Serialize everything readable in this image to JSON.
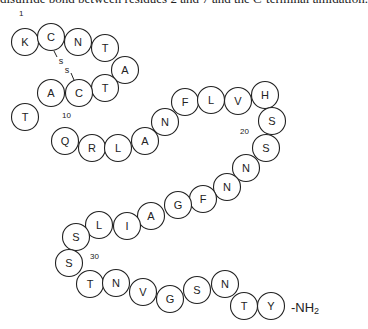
{
  "caption": "disulfide bond between residues 2 and 7 and the C-terminal amidation.",
  "peptide": {
    "residues": [
      {
        "n": 1,
        "aa": "K",
        "x": 25,
        "y": 42
      },
      {
        "n": 2,
        "aa": "C",
        "x": 51,
        "y": 37
      },
      {
        "n": 3,
        "aa": "N",
        "x": 78,
        "y": 42
      },
      {
        "n": 4,
        "aa": "T",
        "x": 105,
        "y": 48
      },
      {
        "n": 5,
        "aa": "A",
        "x": 125,
        "y": 70
      },
      {
        "n": 6,
        "aa": "T",
        "x": 105,
        "y": 88
      },
      {
        "n": 7,
        "aa": "C",
        "x": 79,
        "y": 93
      },
      {
        "n": 8,
        "aa": "A",
        "x": 51,
        "y": 93
      },
      {
        "n": 9,
        "aa": "T",
        "x": 25,
        "y": 117
      },
      {
        "n": 10,
        "aa": "Q",
        "x": 65,
        "y": 141
      },
      {
        "n": 11,
        "aa": "R",
        "x": 92,
        "y": 148
      },
      {
        "n": 12,
        "aa": "L",
        "x": 118,
        "y": 148
      },
      {
        "n": 13,
        "aa": "A",
        "x": 145,
        "y": 141
      },
      {
        "n": 14,
        "aa": "N",
        "x": 165,
        "y": 122
      },
      {
        "n": 15,
        "aa": "F",
        "x": 185,
        "y": 102
      },
      {
        "n": 16,
        "aa": "L",
        "x": 211,
        "y": 100
      },
      {
        "n": 17,
        "aa": "V",
        "x": 238,
        "y": 101
      },
      {
        "n": 18,
        "aa": "H",
        "x": 265,
        "y": 95
      },
      {
        "n": 19,
        "aa": "S",
        "x": 272,
        "y": 121
      },
      {
        "n": 20,
        "aa": "S",
        "x": 266,
        "y": 148
      },
      {
        "n": 21,
        "aa": "N",
        "x": 246,
        "y": 168
      },
      {
        "n": 22,
        "aa": "N",
        "x": 227,
        "y": 187
      },
      {
        "n": 23,
        "aa": "F",
        "x": 203,
        "y": 199
      },
      {
        "n": 24,
        "aa": "G",
        "x": 178,
        "y": 205
      },
      {
        "n": 25,
        "aa": "A",
        "x": 151,
        "y": 216
      },
      {
        "n": 26,
        "aa": "I",
        "x": 127,
        "y": 226
      },
      {
        "n": 27,
        "aa": "L",
        "x": 99,
        "y": 225
      },
      {
        "n": 28,
        "aa": "S",
        "x": 76,
        "y": 237
      },
      {
        "n": 29,
        "aa": "S",
        "x": 69,
        "y": 263
      },
      {
        "n": 30,
        "aa": "T",
        "x": 90,
        "y": 284
      },
      {
        "n": 31,
        "aa": "N",
        "x": 116,
        "y": 283
      },
      {
        "n": 32,
        "aa": "V",
        "x": 143,
        "y": 292
      },
      {
        "n": 33,
        "aa": "G",
        "x": 170,
        "y": 299
      },
      {
        "n": 34,
        "aa": "S",
        "x": 197,
        "y": 290
      },
      {
        "n": 35,
        "aa": "N",
        "x": 225,
        "y": 284
      },
      {
        "n": 36,
        "aa": "T",
        "x": 244,
        "y": 306
      },
      {
        "n": 37,
        "aa": "Y",
        "x": 271,
        "y": 306
      }
    ],
    "position_labels": [
      {
        "text": "1",
        "x": 19,
        "y": 16
      },
      {
        "text": "10",
        "x": 62,
        "y": 118
      },
      {
        "text": "20",
        "x": 240,
        "y": 134
      },
      {
        "text": "30",
        "x": 90,
        "y": 259
      }
    ],
    "disulfide": {
      "s1": "s",
      "s2": "s"
    },
    "c_terminus": {
      "prefix": "-NH",
      "subscript": "2"
    }
  }
}
